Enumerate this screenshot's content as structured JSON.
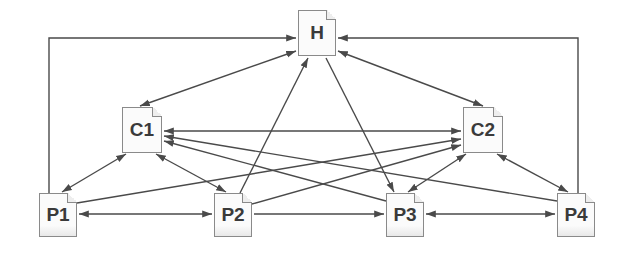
{
  "diagram": {
    "type": "directed-graph",
    "nodes": [
      {
        "id": "H",
        "label": "H",
        "x": 298,
        "y": 10,
        "w": 38,
        "h": 46
      },
      {
        "id": "C1",
        "label": "C1",
        "x": 122,
        "y": 107,
        "w": 40,
        "h": 46
      },
      {
        "id": "C2",
        "label": "C2",
        "x": 463,
        "y": 107,
        "w": 40,
        "h": 46
      },
      {
        "id": "P1",
        "label": "P1",
        "x": 39,
        "y": 193,
        "w": 38,
        "h": 44
      },
      {
        "id": "P2",
        "label": "P2",
        "x": 214,
        "y": 193,
        "w": 38,
        "h": 44
      },
      {
        "id": "P3",
        "label": "P3",
        "x": 386,
        "y": 193,
        "w": 38,
        "h": 44
      },
      {
        "id": "P4",
        "label": "P4",
        "x": 557,
        "y": 193,
        "w": 38,
        "h": 44
      }
    ],
    "edges": [
      {
        "from": "P1",
        "to": "H",
        "bidirectional": false,
        "routing": "left-frame"
      },
      {
        "from": "P4",
        "to": "H",
        "bidirectional": false,
        "routing": "right-frame"
      },
      {
        "from": "C1",
        "to": "H",
        "bidirectional": true
      },
      {
        "from": "C2",
        "to": "H",
        "bidirectional": true
      },
      {
        "from": "P2",
        "to": "H",
        "bidirectional": false
      },
      {
        "from": "H",
        "to": "P3",
        "bidirectional": false
      },
      {
        "from": "C1",
        "to": "C2",
        "bidirectional": true
      },
      {
        "from": "C1",
        "to": "P1",
        "bidirectional": true
      },
      {
        "from": "C1",
        "to": "P2",
        "bidirectional": true
      },
      {
        "from": "P3",
        "to": "C1",
        "bidirectional": false
      },
      {
        "from": "P4",
        "to": "C1",
        "bidirectional": false
      },
      {
        "from": "P1",
        "to": "C2",
        "bidirectional": false
      },
      {
        "from": "P2",
        "to": "C2",
        "bidirectional": false
      },
      {
        "from": "C2",
        "to": "P3",
        "bidirectional": true
      },
      {
        "from": "C2",
        "to": "P4",
        "bidirectional": true
      },
      {
        "from": "P1",
        "to": "P2",
        "bidirectional": true
      },
      {
        "from": "P2",
        "to": "P3",
        "bidirectional": false
      },
      {
        "from": "P3",
        "to": "P4",
        "bidirectional": true
      }
    ]
  },
  "colors": {
    "edge": "#4a4a4a",
    "node_border": "#8a8a8a",
    "node_text": "#3a3a3a"
  }
}
